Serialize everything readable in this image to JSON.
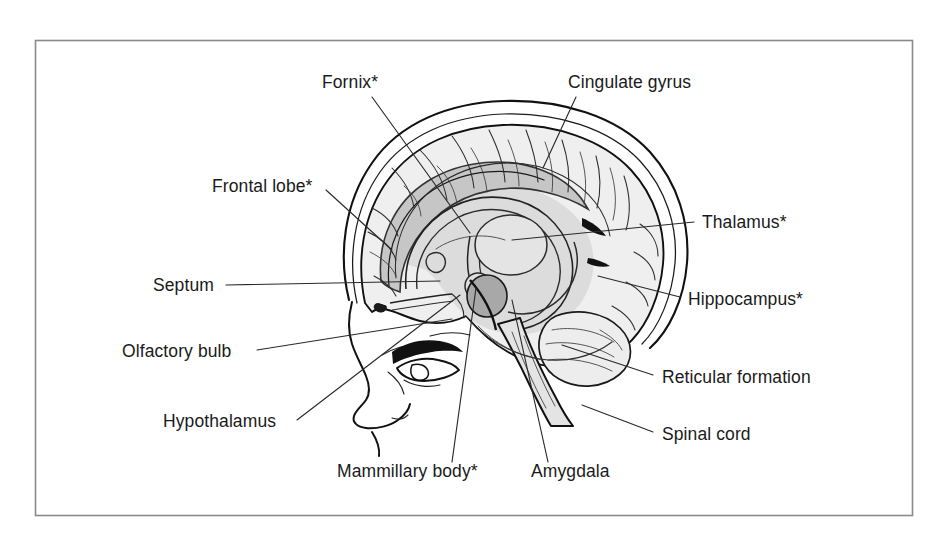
{
  "figure": {
    "border_color": "#8a8a8a",
    "background_color": "#ffffff",
    "footnote_marker": "*",
    "ink_color": "#1a1a1a"
  },
  "palette": {
    "cortex_fill": "#ededed",
    "cortex_fill_light": "#f4f4f4",
    "limbic_fill": "#d8d8d8",
    "corpus_callosum_fill": "#c6c6c6",
    "amygdala_fill": "#a8a8a8",
    "brainstem_fill": "#e2e2e2",
    "outline": "#111111",
    "leader_line": "#2a2a2a",
    "skin": "#ffffff"
  },
  "labels": [
    {
      "id": "fornix",
      "text": "Fornix*",
      "x": 322,
      "y": 88,
      "anchor": "start",
      "side": "top-left",
      "leader": "M 372 97 L 470 233",
      "starred": true
    },
    {
      "id": "cingulate-gyrus",
      "text": "Cingulate gyrus",
      "x": 568,
      "y": 88,
      "anchor": "start",
      "side": "top-right",
      "leader": "M 576 97 L 543 168",
      "starred": false
    },
    {
      "id": "frontal-lobe",
      "text": "Frontal lobe*",
      "x": 212,
      "y": 192,
      "anchor": "start",
      "side": "left",
      "leader": "M 326 190 L 392 250",
      "starred": true
    },
    {
      "id": "thalamus",
      "text": "Thalamus*",
      "x": 702,
      "y": 228,
      "anchor": "start",
      "side": "right",
      "leader": "M 694 222 L 512 240",
      "starred": true
    },
    {
      "id": "septum",
      "text": "Septum",
      "x": 153,
      "y": 291,
      "anchor": "start",
      "side": "left",
      "leader": "M 226 285 L 440 281",
      "starred": false
    },
    {
      "id": "hippocampus",
      "text": "Hippocampus*",
      "x": 688,
      "y": 305,
      "anchor": "start",
      "side": "right",
      "leader": "M 680 297 L 598 276",
      "starred": true
    },
    {
      "id": "olfactory-bulb",
      "text": "Olfactory bulb",
      "x": 122,
      "y": 357,
      "anchor": "start",
      "side": "left",
      "leader": "M 257 350 L 452 319",
      "starred": false
    },
    {
      "id": "reticular-formation",
      "text": "Reticular formation",
      "x": 662,
      "y": 383,
      "anchor": "start",
      "side": "right",
      "leader": "M 653 375 L 562 345",
      "starred": false
    },
    {
      "id": "hypothalamus",
      "text": "Hypothalamus",
      "x": 163,
      "y": 427,
      "anchor": "start",
      "side": "left",
      "leader": "M 297 420 L 460 295",
      "starred": false
    },
    {
      "id": "spinal-cord",
      "text": "Spinal cord",
      "x": 662,
      "y": 440,
      "anchor": "start",
      "side": "right",
      "leader": "M 653 432 L 582 405",
      "starred": false
    },
    {
      "id": "mammillary-body",
      "text": "Mammillary body*",
      "x": 337,
      "y": 477,
      "anchor": "start",
      "side": "bottom",
      "leader": "M 452 462 L 476 288",
      "starred": true
    },
    {
      "id": "amygdala",
      "text": "Amygdala",
      "x": 531,
      "y": 477,
      "anchor": "start",
      "side": "bottom",
      "leader": "M 548 462 L 512 300",
      "starred": false
    }
  ],
  "structures": [
    {
      "id": "skull-scalp",
      "name": "Skull and scalp outline"
    },
    {
      "id": "cerebral-cortex",
      "name": "Cerebral cortex"
    },
    {
      "id": "corpus-callosum",
      "name": "Corpus callosum"
    },
    {
      "id": "fornix-arc",
      "name": "Fornix arc"
    },
    {
      "id": "thalamus-body",
      "name": "Thalamus"
    },
    {
      "id": "amygdala-body",
      "name": "Amygdala"
    },
    {
      "id": "brainstem",
      "name": "Brainstem and spinal cord"
    },
    {
      "id": "cerebellum",
      "name": "Cerebellum"
    },
    {
      "id": "face-profile",
      "name": "Face profile with eye and nose"
    }
  ]
}
